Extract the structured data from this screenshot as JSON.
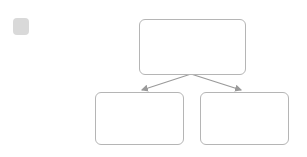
{
  "problem_number": "2",
  "colors": {
    "dot": "#8f8f8f",
    "box_border": "#b5b5b5",
    "badge_bg": "#d9d9d9",
    "arrow": "#9a9a9a"
  },
  "diagram": {
    "top_box": {
      "total_dots": 12,
      "rows": [
        {
          "count": 5,
          "crossed": true
        },
        {
          "count": 5,
          "crossed": false
        },
        {
          "count": 2,
          "crossed": false
        }
      ]
    },
    "bottom_left_box": {
      "dots": 5
    },
    "bottom_right_box": {
      "dots": 0,
      "content": ""
    }
  }
}
